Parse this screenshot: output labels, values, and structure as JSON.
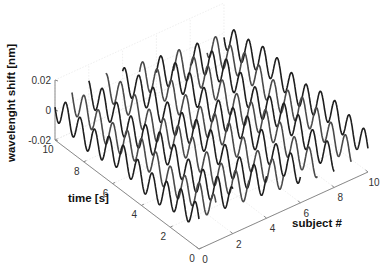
{
  "chart_data": {
    "type": "line",
    "subtype": "3d-waterfall",
    "title": "",
    "xlabel": "subject #",
    "ylabel": "time [s]",
    "zlabel": "wavelenght shift  [nm]",
    "x_ticks": [
      "0",
      "2",
      "4",
      "6",
      "8",
      "10"
    ],
    "y_ticks": [
      "0",
      "2",
      "4",
      "6",
      "8",
      "10"
    ],
    "z_ticks": [
      "-0.02",
      "0",
      "0.02"
    ],
    "xlim": [
      0,
      10
    ],
    "ylim": [
      0,
      10
    ],
    "zlim": [
      -0.02,
      0.02
    ],
    "grid": true,
    "legend": null,
    "series_description": "11 sinusoidal traces (subjects 0-10) of wavelength shift vs time, amplitude ~0.01 nm, ~1 Hz",
    "series": [
      {
        "name": "subject 0",
        "subject": 0,
        "amplitude": 0.009,
        "frequency_hz": 1.0,
        "phase": 0.0
      },
      {
        "name": "subject 1",
        "subject": 1,
        "amplitude": 0.009,
        "frequency_hz": 1.0,
        "phase": 0.6
      },
      {
        "name": "subject 2",
        "subject": 2,
        "amplitude": 0.009,
        "frequency_hz": 1.0,
        "phase": 1.2
      },
      {
        "name": "subject 3",
        "subject": 3,
        "amplitude": 0.009,
        "frequency_hz": 1.0,
        "phase": 1.8
      },
      {
        "name": "subject 4",
        "subject": 4,
        "amplitude": 0.009,
        "frequency_hz": 1.0,
        "phase": 2.4
      },
      {
        "name": "subject 5",
        "subject": 5,
        "amplitude": 0.009,
        "frequency_hz": 1.0,
        "phase": 3.0
      },
      {
        "name": "subject 6",
        "subject": 6,
        "amplitude": 0.009,
        "frequency_hz": 1.0,
        "phase": 3.6
      },
      {
        "name": "subject 7",
        "subject": 7,
        "amplitude": 0.009,
        "frequency_hz": 1.0,
        "phase": 4.2
      },
      {
        "name": "subject 8",
        "subject": 8,
        "amplitude": 0.009,
        "frequency_hz": 1.0,
        "phase": 4.8
      },
      {
        "name": "subject 9",
        "subject": 9,
        "amplitude": 0.009,
        "frequency_hz": 1.0,
        "phase": 5.4
      },
      {
        "name": "subject 10",
        "subject": 10,
        "amplitude": 0.009,
        "frequency_hz": 1.0,
        "phase": 6.0
      }
    ]
  },
  "colors": {
    "line_dark": "#1e1e1e",
    "line_mid": "#4a4a4a",
    "axis": "#8a8a8a",
    "grid": "#e2e2e2"
  }
}
